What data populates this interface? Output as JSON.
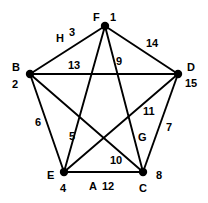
{
  "figure": {
    "name": "complete-graph-k5",
    "background_color": "#ffffff",
    "line_color": "#000000",
    "vertex_color": "#000000"
  },
  "vertices": [
    {
      "id": "F",
      "letter": "F",
      "number": "1",
      "x": 105,
      "y": 26
    },
    {
      "id": "B",
      "letter": "B",
      "number": "2",
      "x": 30,
      "y": 74
    },
    {
      "id": "D",
      "letter": "D",
      "number": "15",
      "x": 178,
      "y": 74
    },
    {
      "id": "E",
      "letter": "E",
      "number": "4",
      "x": 64,
      "y": 172
    },
    {
      "id": "C",
      "letter": "C",
      "number": "8",
      "x": 143,
      "y": 172
    }
  ],
  "edges": [
    {
      "from": "B",
      "to": "F",
      "weight": "3",
      "letter": "H"
    },
    {
      "from": "F",
      "to": "D",
      "weight": "14",
      "letter": ""
    },
    {
      "from": "B",
      "to": "D",
      "weight": "13",
      "letter": ""
    },
    {
      "from": "F",
      "to": "C",
      "weight": "9",
      "letter": ""
    },
    {
      "from": "F",
      "to": "E",
      "weight": "5",
      "letter": ""
    },
    {
      "from": "B",
      "to": "E",
      "weight": "6",
      "letter": ""
    },
    {
      "from": "B",
      "to": "C",
      "weight": "10",
      "letter": ""
    },
    {
      "from": "D",
      "to": "E",
      "weight": "11",
      "letter": ""
    },
    {
      "from": "D",
      "to": "C",
      "weight": "7",
      "letter": "G"
    },
    {
      "from": "E",
      "to": "C",
      "weight": "12",
      "letter": "A"
    }
  ],
  "edge_labels": [
    {
      "id": "label-3",
      "text": "3",
      "x": 69,
      "y": 27
    },
    {
      "id": "label-H",
      "text": "H",
      "x": 56,
      "y": 33
    },
    {
      "id": "label-14",
      "text": "14",
      "x": 146,
      "y": 38
    },
    {
      "id": "label-13",
      "text": "13",
      "x": 68,
      "y": 60
    },
    {
      "id": "label-9",
      "text": "9",
      "x": 116,
      "y": 56
    },
    {
      "id": "label-6",
      "text": "6",
      "x": 35,
      "y": 117
    },
    {
      "id": "label-5",
      "text": "5",
      "x": 69,
      "y": 131
    },
    {
      "id": "label-11",
      "text": "11",
      "x": 143,
      "y": 106
    },
    {
      "id": "label-7",
      "text": "7",
      "x": 166,
      "y": 122
    },
    {
      "id": "label-G",
      "text": "G",
      "x": 138,
      "y": 132
    },
    {
      "id": "label-10",
      "text": "10",
      "x": 110,
      "y": 155
    },
    {
      "id": "label-A",
      "text": "A",
      "x": 89,
      "y": 181
    },
    {
      "id": "label-12",
      "text": "12",
      "x": 102,
      "y": 181
    }
  ],
  "vertex_labels": [
    {
      "id": "vlabel-F",
      "text": "F",
      "x": 93,
      "y": 12,
      "kind": "letter"
    },
    {
      "id": "vlabel-F1",
      "text": "1",
      "x": 110,
      "y": 12,
      "kind": "number"
    },
    {
      "id": "vlabel-B",
      "text": "B",
      "x": 12,
      "y": 62,
      "kind": "letter"
    },
    {
      "id": "vlabel-B2",
      "text": "2",
      "x": 12,
      "y": 79,
      "kind": "number"
    },
    {
      "id": "vlabel-D",
      "text": "D",
      "x": 187,
      "y": 62,
      "kind": "letter"
    },
    {
      "id": "vlabel-D15",
      "text": "15",
      "x": 185,
      "y": 78,
      "kind": "number"
    },
    {
      "id": "vlabel-E",
      "text": "E",
      "x": 47,
      "y": 170,
      "kind": "letter"
    },
    {
      "id": "vlabel-E4",
      "text": "4",
      "x": 60,
      "y": 183,
      "kind": "number"
    },
    {
      "id": "vlabel-C",
      "text": "C",
      "x": 139,
      "y": 183,
      "kind": "letter"
    },
    {
      "id": "vlabel-C8",
      "text": "8",
      "x": 156,
      "y": 170,
      "kind": "number"
    }
  ],
  "chart_data": {
    "type": "diagram",
    "title": "",
    "graph_type": "complete-graph-K5",
    "node_count": 5,
    "edge_count": 10,
    "nodes": [
      {
        "label": "F",
        "value": 1
      },
      {
        "label": "B",
        "value": 2
      },
      {
        "label": "E",
        "value": 4
      },
      {
        "label": "C",
        "value": 8
      },
      {
        "label": "D",
        "value": 15
      }
    ],
    "edges": [
      {
        "endpoints": [
          "B",
          "F"
        ],
        "weight": 3,
        "name": "H"
      },
      {
        "endpoints": [
          "E",
          "F"
        ],
        "weight": 5,
        "name": ""
      },
      {
        "endpoints": [
          "B",
          "E"
        ],
        "weight": 6,
        "name": ""
      },
      {
        "endpoints": [
          "C",
          "D"
        ],
        "weight": 7,
        "name": "G"
      },
      {
        "endpoints": [
          "C",
          "F"
        ],
        "weight": 9,
        "name": ""
      },
      {
        "endpoints": [
          "B",
          "C"
        ],
        "weight": 10,
        "name": ""
      },
      {
        "endpoints": [
          "D",
          "E"
        ],
        "weight": 11,
        "name": ""
      },
      {
        "endpoints": [
          "C",
          "E"
        ],
        "weight": 12,
        "name": "A"
      },
      {
        "endpoints": [
          "B",
          "D"
        ],
        "weight": 13,
        "name": ""
      },
      {
        "endpoints": [
          "D",
          "F"
        ],
        "weight": 14,
        "name": ""
      }
    ]
  }
}
